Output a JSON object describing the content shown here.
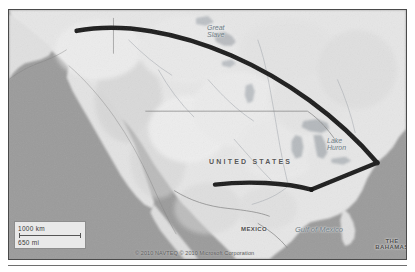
{
  "map": {
    "provider_attribution": "© 2010 NAVTEQ  © 2010 Microsoft Corporation",
    "scale": {
      "metric": "1000 km",
      "imperial": "650 mi"
    },
    "labels": [
      {
        "id": "great-slave",
        "text": "Great",
        "text2": "Slave",
        "kind": "water"
      },
      {
        "id": "lake-huron",
        "text": "Lake",
        "text2": "Huron",
        "kind": "water"
      },
      {
        "id": "united-states",
        "text": "UNITED STATES",
        "kind": "country"
      },
      {
        "id": "mexico",
        "text": "MEXICO",
        "kind": "country"
      },
      {
        "id": "gulf-of-mexico",
        "text": "Gulf of Mexico",
        "kind": "water"
      },
      {
        "id": "the-bahamas",
        "text": "THE",
        "text2": "BAHAMAS",
        "kind": "country"
      }
    ],
    "label_text": {
      "great_slave_line1": "Great",
      "great_slave_line2": "Slave",
      "lake_huron_line1": "Lake",
      "lake_huron_line2": "Huron",
      "united_states": "UNITED STATES",
      "mexico": "MEXICO",
      "gulf_of_mexico": "Gulf of Mexico",
      "bahamas_line1": "THE",
      "bahamas_line2": "BAHAMAS"
    },
    "colors": {
      "ocean": "#9b9b9b",
      "land": "#e3e3e3",
      "land_highlight": "#f2f2f2",
      "route": "#1c1c1c",
      "border_line": "#8f8f8f",
      "frame": "#4a4a4a"
    },
    "routes": [
      {
        "id": "northern-arc",
        "description": "great-circle arc from northwest coast to eastern node",
        "start": [
          76,
          30
        ],
        "end": [
          378,
          163
        ]
      },
      {
        "id": "southern-leg",
        "description": "leg from southwest interior to southern node",
        "start": [
          215,
          185
        ],
        "end": [
          312,
          190
        ]
      },
      {
        "id": "eastern-leg",
        "description": "leg from southern node up to eastern node",
        "start": [
          312,
          190
        ],
        "end": [
          378,
          163
        ]
      }
    ],
    "nodes": [
      {
        "id": "node-east",
        "x": 378,
        "y": 163
      },
      {
        "id": "node-south",
        "x": 312,
        "y": 190
      }
    ]
  }
}
